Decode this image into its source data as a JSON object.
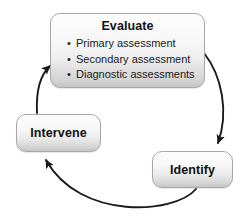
{
  "diagram": {
    "background_color": "#ffffff",
    "node_fill_top": "#fdfdfd",
    "node_fill_bottom": "#c4c4c4",
    "node_border_color": "#a8a8a8",
    "text_color": "#111111",
    "arrow_color": "#1a1a1a",
    "nodes": [
      {
        "id": "evaluate",
        "title": "Evaluate",
        "bullet_glyph": "•",
        "items": [
          "Primary assessment",
          "Secondary assessment",
          "Diagnostic assessments"
        ]
      },
      {
        "id": "intervene",
        "label": "Intervene"
      },
      {
        "id": "identify",
        "label": "Identify"
      }
    ],
    "arrows": [
      {
        "id": "evaluate-to-identify",
        "from": "evaluate",
        "to": "identify"
      },
      {
        "id": "identify-to-intervene",
        "from": "identify",
        "to": "intervene"
      },
      {
        "id": "intervene-to-evaluate",
        "from": "intervene",
        "to": "evaluate"
      }
    ]
  }
}
